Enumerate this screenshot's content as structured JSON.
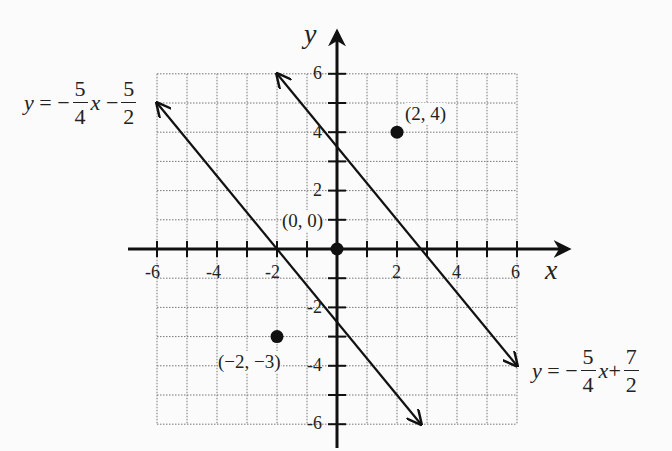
{
  "chart_data": {
    "type": "line",
    "title": "",
    "xlabel": "x",
    "ylabel": "y",
    "xlim": [
      -6,
      6
    ],
    "ylim": [
      -6,
      6
    ],
    "grid": true,
    "x_ticks": [
      -6,
      -4,
      -2,
      2,
      4,
      6
    ],
    "y_ticks": [
      6,
      4,
      2,
      -2,
      -4,
      -6
    ],
    "series": [
      {
        "name": "y = -5/4 x - 5/2",
        "slope": -1.25,
        "intercept": -2.5,
        "x": [
          -6,
          2.8
        ],
        "y": [
          5,
          -6
        ]
      },
      {
        "name": "y = -5/4 x + 7/2",
        "slope": -1.25,
        "intercept": 3.5,
        "x": [
          -2,
          6
        ],
        "y": [
          6,
          -4
        ]
      }
    ],
    "points": [
      {
        "label": "(2,4)",
        "x": 2,
        "y": 4
      },
      {
        "label": "(0,0)",
        "x": 0,
        "y": 0
      },
      {
        "label": "(-2,-3)",
        "x": -2,
        "y": -3
      }
    ]
  },
  "axes": {
    "x_label": "x",
    "y_label": "y"
  },
  "ticks": {
    "x": [
      "-6",
      "-4",
      "-2",
      "2",
      "4",
      "6"
    ],
    "y": [
      "6",
      "4",
      "2",
      "-2",
      "-4",
      "-6"
    ]
  },
  "equations": {
    "left": {
      "lhs": "y",
      "eq": "=",
      "neg": "−",
      "num1": "5",
      "den1": "4",
      "var": "x",
      "op": "−",
      "num2": "5",
      "den2": "2"
    },
    "right": {
      "lhs": "y",
      "eq": "=",
      "neg": "−",
      "num1": "5",
      "den1": "4",
      "var": "x",
      "op": "+",
      "num2": "7",
      "den2": "2"
    }
  },
  "point_labels": {
    "p1": "(2, 4)",
    "p2": "(0, 0)",
    "p3": "(−2, −3)"
  }
}
